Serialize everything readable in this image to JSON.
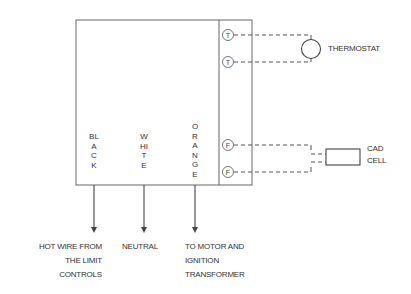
{
  "diagram": {
    "title": "",
    "terminals": [
      {
        "id": "T1",
        "label": "T"
      },
      {
        "id": "T2",
        "label": "T"
      },
      {
        "id": "F1",
        "label": "F"
      },
      {
        "id": "F2",
        "label": "F"
      }
    ],
    "wires": [
      {
        "color_name": "BLACK",
        "letters": "BLACK",
        "destination": [
          "HOT WIRE FROM",
          "THE LIMIT",
          "CONTROLS"
        ]
      },
      {
        "color_name": "WHITE",
        "letters": "WHITE",
        "destination": [
          "NEUTRAL"
        ]
      },
      {
        "color_name": "ORANGE",
        "letters": "ORANGE",
        "destination": [
          "TO MOTOR AND",
          "IGNITION",
          "TRANSFORMER"
        ]
      }
    ],
    "components": {
      "thermostat": {
        "label": "THERMOSTAT"
      },
      "cad_cell": {
        "label_line1": "CAD",
        "label_line2": "CELL"
      }
    },
    "colors": {
      "line": "#555555",
      "text": "#333333",
      "background": "#ffffff"
    }
  }
}
